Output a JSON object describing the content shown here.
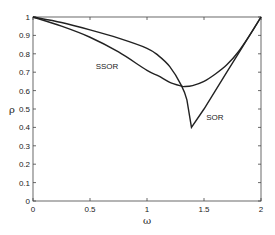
{
  "chart_data": {
    "type": "line",
    "title": "",
    "xlabel": "ω",
    "ylabel": "ρ",
    "xlim": [
      0,
      2
    ],
    "ylim": [
      0,
      1
    ],
    "grid": false,
    "legend": "none (inline curve labels)",
    "xticks": [
      "0",
      "0.5",
      "1",
      "1.5",
      "2"
    ],
    "yticks": [
      "0",
      "0.1",
      "0.2",
      "0.3",
      "0.4",
      "0.5",
      "0.6",
      "0.7",
      "0.8",
      "0.9",
      "1"
    ],
    "series": [
      {
        "name": "SOR",
        "color": "#222222",
        "x": [
          0,
          0.25,
          0.5,
          0.75,
          1.0,
          1.1,
          1.2,
          1.3,
          1.35,
          1.39,
          1.5,
          1.6,
          1.7,
          1.8,
          1.9,
          2.0
        ],
        "y": [
          1.0,
          0.97,
          0.93,
          0.885,
          0.83,
          0.79,
          0.73,
          0.63,
          0.55,
          0.4,
          0.5,
          0.6,
          0.7,
          0.8,
          0.9,
          1.0
        ]
      },
      {
        "name": "SSOR",
        "color": "#222222",
        "x": [
          0,
          0.25,
          0.5,
          0.75,
          1.0,
          1.1,
          1.2,
          1.3,
          1.33,
          1.4,
          1.5,
          1.6,
          1.7,
          1.8,
          1.9,
          2.0
        ],
        "y": [
          1.0,
          0.95,
          0.89,
          0.81,
          0.71,
          0.68,
          0.645,
          0.625,
          0.622,
          0.627,
          0.65,
          0.69,
          0.74,
          0.81,
          0.9,
          1.0
        ]
      }
    ],
    "annotations": [
      {
        "text": "SSOR",
        "x": 0.55,
        "y": 0.72
      },
      {
        "text": "SOR",
        "x": 1.52,
        "y": 0.44
      }
    ]
  }
}
